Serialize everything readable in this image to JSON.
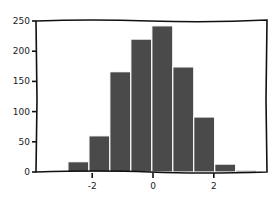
{
  "chart_data": {
    "type": "bar",
    "style": "xkcd histogram",
    "title": "",
    "xlabel": "",
    "ylabel": "",
    "bin_edges": [
      -2.8,
      -2.11,
      -1.42,
      -0.73,
      -0.04,
      0.65,
      1.34,
      2.03,
      2.72,
      3.41
    ],
    "values": [
      17,
      60,
      166,
      220,
      242,
      174,
      91,
      13,
      3
    ],
    "xlim": [
      -3.8,
      3.8
    ],
    "ylim": [
      0,
      250
    ],
    "x_ticks": [
      -2,
      0,
      2
    ],
    "x_tick_labels": [
      "-2",
      "0",
      "2"
    ],
    "y_ticks": [
      0,
      50,
      100,
      150,
      200,
      250
    ],
    "y_tick_labels": [
      "0",
      "50",
      "100",
      "150",
      "200",
      "250"
    ],
    "bar_color": "#4a4a4a",
    "edge_color": "#ffffff",
    "grid": false,
    "legend": null
  }
}
